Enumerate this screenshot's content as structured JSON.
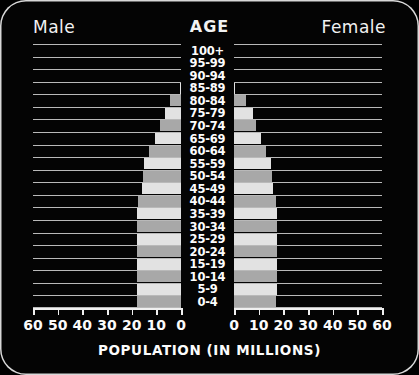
{
  "header": {
    "male_label": "Male",
    "age_label": "AGE",
    "female_label": "Female"
  },
  "axis_title": "POPULATION (IN MILLIONS)",
  "male_ticks": [
    "60",
    "50",
    "40",
    "30",
    "20",
    "10",
    "0"
  ],
  "female_ticks": [
    "0",
    "10",
    "20",
    "30",
    "40",
    "50",
    "60"
  ],
  "colors": {
    "background": "#040404",
    "frame": "#d8d8d8",
    "gridline": "#b9b9b9",
    "bar_light": "#e2e2e2",
    "bar_medium": "#a8a8a8",
    "text": "#ffffff"
  },
  "chart_data": {
    "type": "bar",
    "title": "",
    "subtitle": "",
    "xlabel": "POPULATION (IN MILLIONS)",
    "ylabel": "AGE",
    "orientation": "horizontal",
    "layout": "population-pyramid",
    "grid": true,
    "legend_position": "none",
    "xlim": [
      0,
      60
    ],
    "xticks": [
      0,
      10,
      20,
      30,
      40,
      50,
      60
    ],
    "categories": [
      "100+",
      "95-99",
      "90-94",
      "85-89",
      "80-84",
      "75-79",
      "70-74",
      "65-69",
      "60-64",
      "55-59",
      "50-54",
      "45-49",
      "40-44",
      "35-39",
      "30-34",
      "25-29",
      "20-24",
      "15-19",
      "10-14",
      "5-9",
      "0-4"
    ],
    "series": [
      {
        "name": "Male",
        "side": "left",
        "values": [
          0,
          0,
          0,
          0.4,
          4.5,
          6.5,
          8.5,
          10.5,
          13.0,
          15.0,
          15.5,
          16.0,
          17.5,
          18.0,
          18.0,
          18.0,
          18.0,
          18.0,
          18.0,
          18.0,
          18.0
        ]
      },
      {
        "name": "Female",
        "side": "right",
        "values": [
          0,
          0,
          0,
          0.4,
          5.0,
          7.5,
          9.0,
          11.0,
          13.0,
          15.0,
          15.5,
          16.0,
          17.0,
          17.5,
          17.5,
          17.5,
          17.5,
          17.5,
          17.5,
          17.5,
          17.0
        ]
      }
    ],
    "bar_shading": "alternating light and medium gray by age band"
  }
}
